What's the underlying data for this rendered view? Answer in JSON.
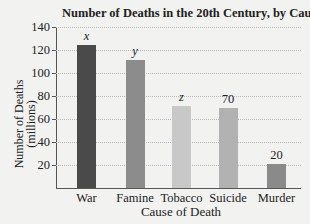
{
  "chart_data": {
    "type": "bar",
    "title": "Number of Deaths in the 20th Century, by Cause",
    "xlabel": "Cause of Death",
    "ylabel": "Number of Deaths (millions)",
    "ylabel_lines": [
      "Number of Deaths",
      "(millions)"
    ],
    "categories": [
      "War",
      "Famine",
      "Tobacco",
      "Suicide",
      "Murder"
    ],
    "values": [
      124,
      111,
      71,
      70,
      21
    ],
    "bar_labels": [
      "x",
      "y",
      "z",
      "70",
      "20"
    ],
    "bar_colors": [
      "#4a4a4a",
      "#8c8c8c",
      "#c8c8c8",
      "#b2b2b2",
      "#8a8a8a"
    ],
    "ylim": [
      0,
      140
    ],
    "yticks": [
      20,
      40,
      60,
      80,
      100,
      120,
      140
    ],
    "grid": true,
    "legend": null
  }
}
